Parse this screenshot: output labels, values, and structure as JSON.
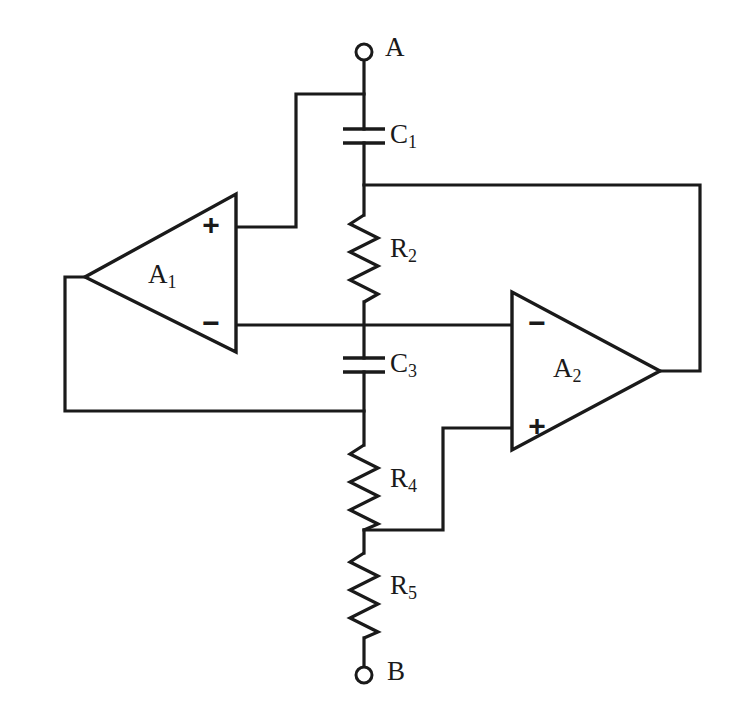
{
  "diagram": {
    "type": "electronic-schematic",
    "background_color": "#ffffff",
    "line_color": "#1a1a1a",
    "width": 737,
    "height": 719
  },
  "terminals": [
    {
      "id": "A",
      "label": "A",
      "x": 364,
      "y": 52,
      "label_x": 385,
      "label_y": 50
    },
    {
      "id": "B",
      "label": "B",
      "x": 364,
      "y": 675,
      "label_x": 387,
      "label_y": 674
    }
  ],
  "amplifiers": [
    {
      "id": "A1",
      "label": "A",
      "subscript": "1",
      "orientation": "points-left",
      "label_x": 160,
      "label_y": 277,
      "terminals": [
        {
          "sign": "+",
          "x": 211,
          "y": 227
        },
        {
          "sign": "−",
          "x": 211,
          "y": 325
        }
      ]
    },
    {
      "id": "A2",
      "label": "A",
      "subscript": "2",
      "orientation": "points-right",
      "label_x": 565,
      "label_y": 371,
      "terminals": [
        {
          "sign": "−",
          "x": 537,
          "y": 325
        },
        {
          "sign": "+",
          "x": 537,
          "y": 428
        }
      ]
    }
  ],
  "components": [
    {
      "id": "C1",
      "kind": "capacitor",
      "label": "C",
      "subscript": "1",
      "label_x": 390,
      "label_y": 137
    },
    {
      "id": "R2",
      "kind": "resistor",
      "label": "R",
      "subscript": "2",
      "label_x": 390,
      "label_y": 251
    },
    {
      "id": "C3",
      "kind": "capacitor",
      "label": "C",
      "subscript": "3",
      "label_x": 390,
      "label_y": 366
    },
    {
      "id": "R4",
      "kind": "resistor",
      "label": "R",
      "subscript": "4",
      "label_x": 390,
      "label_y": 481
    },
    {
      "id": "R5",
      "kind": "resistor",
      "label": "R",
      "subscript": "5",
      "label_x": 390,
      "label_y": 588
    }
  ],
  "junction_nodes": [
    {
      "id": "node-A-top",
      "x": 364,
      "y": 94
    },
    {
      "id": "node-C1-R2",
      "x": 364,
      "y": 185
    },
    {
      "id": "node-R2-C3",
      "x": 364,
      "y": 325
    },
    {
      "id": "node-C3-R4",
      "x": 364,
      "y": 411
    },
    {
      "id": "node-R4-R5",
      "x": 364,
      "y": 530
    }
  ],
  "nets": [
    {
      "id": "net-a1-out-to-a1-feedback",
      "description": "A1 output apex to left rail down to C3 bottom node"
    },
    {
      "id": "net-a1-plus-to-nodeA",
      "description": "A1 plus terminal stepped up to terminal A"
    },
    {
      "id": "net-a2-out-to-c1r2",
      "description": "A2 output right and up to C1/R2 junction"
    },
    {
      "id": "net-inverting-bus",
      "description": "A1 minus to R2/C3 node to A2 minus"
    },
    {
      "id": "net-r4r5-to-a2-plus",
      "description": "R4/R5 junction stepped up to A2 plus terminal"
    }
  ]
}
